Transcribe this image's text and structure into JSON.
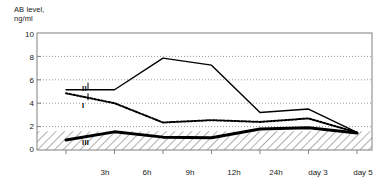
{
  "chart_data": {
    "type": "line",
    "title": "",
    "ylabel": "AB level,\nng/ml",
    "xlabel": "",
    "ylim": [
      0,
      10
    ],
    "yticks": [
      "0",
      "2",
      "4",
      "6",
      "8",
      "10"
    ],
    "ytick_values": [
      0,
      2,
      4,
      6,
      8,
      10
    ],
    "grid": true,
    "grid_style": "dotted-horizontal",
    "legend": "inline-labels",
    "categories": [
      "3h",
      "6h",
      "9h",
      "12h",
      "24h",
      "day 3",
      "day 5"
    ],
    "series": [
      {
        "name": "I",
        "style": "dotted",
        "label_x_index": 0,
        "values": [
          4.85,
          4.0,
          2.35,
          2.55,
          2.4,
          2.7,
          1.5
        ]
      },
      {
        "name": "II",
        "style": "solid-thin",
        "label_x_index": 0,
        "values": [
          5.15,
          5.15,
          7.85,
          7.25,
          3.2,
          3.5,
          1.5
        ]
      },
      {
        "name": "III",
        "style": "solid-thick",
        "label_x_index": 0,
        "values": [
          0.85,
          1.55,
          1.1,
          1.05,
          1.8,
          1.9,
          1.45
        ]
      }
    ],
    "annotations": [
      {
        "text": "II",
        "series": "II",
        "x": "3h"
      },
      {
        "text": "I",
        "series": "I",
        "x": "3h"
      },
      {
        "text": "III",
        "series": "III",
        "x": "3h"
      }
    ],
    "shaded_band": {
      "label": "reference range",
      "pattern": "diagonal-hatch",
      "from": 0,
      "to": 1.6,
      "color": "#b0b0b0"
    },
    "colors": {
      "line": "#000000",
      "axis": "#808080",
      "grid": "#999999",
      "hatch": "#9a9a9a",
      "text": "#1a1a1a"
    }
  }
}
